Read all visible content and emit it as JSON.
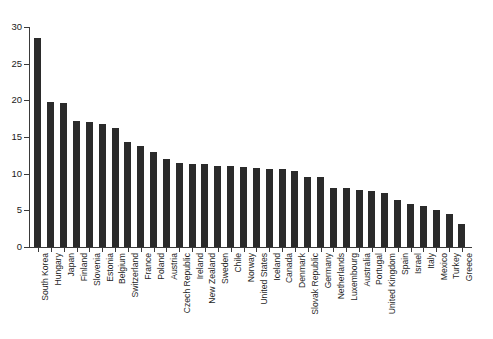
{
  "chart_data": {
    "type": "bar",
    "title": "",
    "subtitle": "",
    "xlabel": "",
    "ylabel": "",
    "ylim": [
      0,
      30
    ],
    "yticks": [
      0,
      5,
      10,
      15,
      20,
      25,
      30
    ],
    "grid": false,
    "legend": null,
    "bar_color": "#2b2b2b",
    "axis_color": "#3a3a3a",
    "background": "#ffffff",
    "categories": [
      "South Korea",
      "Hungary",
      "Japan",
      "Finland",
      "Slovenia",
      "Estonia",
      "Belgium",
      "Switzerland",
      "France",
      "Poland",
      "Austria",
      "Czech Republic",
      "Ireland",
      "New Zealand",
      "Sweden",
      "Chile",
      "Norway",
      "United States",
      "Iceland",
      "Canada",
      "Denmark",
      "Slovak Republic",
      "Germany",
      "Netherlands",
      "Luxembourg",
      "Australia",
      "Portugal",
      "United Kingdom",
      "Spain",
      "Israel",
      "Italy",
      "Mexico",
      "Turkey",
      "Greece"
    ],
    "values": [
      28.5,
      19.8,
      19.7,
      17.2,
      17.1,
      16.8,
      16.2,
      14.3,
      13.8,
      13.0,
      12.0,
      11.4,
      11.3,
      11.3,
      11.1,
      11.1,
      10.9,
      10.8,
      10.7,
      10.6,
      10.4,
      9.6,
      9.5,
      8.1,
      8.1,
      7.8,
      7.7,
      7.4,
      6.4,
      5.8,
      5.6,
      5.0,
      4.5,
      3.1
    ]
  }
}
